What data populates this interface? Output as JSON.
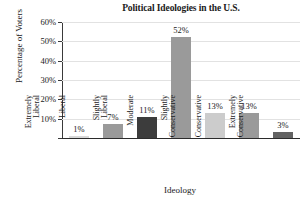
{
  "chart_data": {
    "type": "bar",
    "title": "Political Ideologies in the U.S.",
    "xlabel": "Ideology",
    "ylabel": "Percentage of Voters",
    "categories": [
      "Extremely Liberal",
      "Liberal",
      "Slightly Liberal",
      "Moderate",
      "Slightly Conservative",
      "Conservative",
      "Extremely Conservative"
    ],
    "category_lines": [
      [
        "Extremely",
        "Liberal"
      ],
      [
        "Liberal",
        ""
      ],
      [
        "Slightly",
        "Liberal"
      ],
      [
        "Moderate",
        ""
      ],
      [
        "Slightly",
        "Conservative"
      ],
      [
        "Conservative",
        ""
      ],
      [
        "Extremely",
        "Conservative"
      ]
    ],
    "values": [
      1,
      7,
      11,
      52,
      13,
      13,
      3
    ],
    "value_labels": [
      "1%",
      "7%",
      "11%",
      "52%",
      "13%",
      "13%",
      "3%"
    ],
    "bar_colors": [
      "#d8d8d8",
      "#9a9a9a",
      "#3c3c3c",
      "#9a9a9a",
      "#cccccc",
      "#9a9a9a",
      "#636363"
    ],
    "ylim": [
      0,
      60
    ],
    "yticks": [
      0,
      10,
      20,
      30,
      40,
      50,
      60
    ],
    "ytick_labels": [
      "",
      "10%",
      "20%",
      "30%",
      "40%",
      "50%",
      "60%"
    ],
    "grid": true,
    "legend": "none",
    "grid_color": "#e2e2e2",
    "axis_color": "#2b2b2b"
  }
}
